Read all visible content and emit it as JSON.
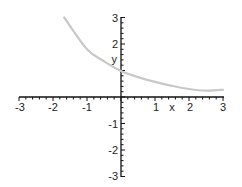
{
  "chart_data": {
    "type": "line",
    "title": "",
    "xlabel": "x",
    "ylabel": "y",
    "xlim": [
      -3,
      3
    ],
    "ylim": [
      -3,
      3
    ],
    "grid": false,
    "legend": null,
    "x_ticks": [
      "-3",
      "-2",
      "-1",
      "1",
      "2",
      "3"
    ],
    "y_ticks": [
      "3",
      "2",
      "-1",
      "-2",
      "-3"
    ],
    "series": [
      {
        "name": "curve",
        "color": "#c8c8c8",
        "x": [
          -1.67,
          -1.0,
          -0.5,
          0.0,
          0.5,
          1.0,
          1.5,
          2.0,
          2.5,
          3.0
        ],
        "y": [
          3.0,
          1.8,
          1.35,
          0.98,
          0.75,
          0.57,
          0.42,
          0.3,
          0.24,
          0.27
        ]
      }
    ]
  },
  "style": {
    "axis_color": "#111111",
    "curve_color": "#c8c8c8"
  }
}
